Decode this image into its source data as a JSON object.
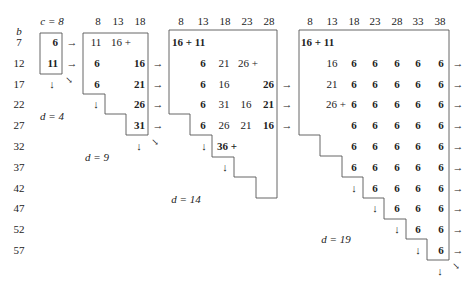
{
  "row_axis": {
    "label": "b",
    "values": [
      "7",
      "12",
      "17",
      "22",
      "27",
      "32",
      "37",
      "42",
      "47",
      "52",
      "57"
    ]
  },
  "panels": [
    {
      "id": "d4",
      "header_label": "c = 8",
      "columns": [
        "8"
      ],
      "caption": "d = 4",
      "cells": [
        {
          "row": 0,
          "col": 0,
          "text": "6",
          "bold": true
        },
        {
          "row": 1,
          "col": 0,
          "text": "11",
          "bold": true
        }
      ]
    },
    {
      "id": "d9",
      "columns": [
        "8",
        "13",
        "18"
      ],
      "caption": "d = 9",
      "cells": [
        {
          "row": 0,
          "col": 0,
          "text": "11",
          "bold": false
        },
        {
          "row": 0,
          "col": 1,
          "text": "16 +",
          "bold": false
        },
        {
          "row": 1,
          "col": 0,
          "text": "6",
          "bold": true
        },
        {
          "row": 1,
          "col": 2,
          "text": "16",
          "bold": true
        },
        {
          "row": 2,
          "col": 0,
          "text": "6",
          "bold": true
        },
        {
          "row": 2,
          "col": 2,
          "text": "21",
          "bold": true
        },
        {
          "row": 3,
          "col": 2,
          "text": "26",
          "bold": true
        },
        {
          "row": 4,
          "col": 2,
          "text": "31",
          "bold": true
        }
      ]
    },
    {
      "id": "d14",
      "columns": [
        "8",
        "13",
        "18",
        "23",
        "28"
      ],
      "caption": "d = 14",
      "cells": [
        {
          "row": 0,
          "col": 0,
          "text": "16 + 11",
          "bold": true
        },
        {
          "row": 1,
          "col": 1,
          "text": "6",
          "bold": true
        },
        {
          "row": 1,
          "col": 2,
          "text": "21",
          "bold": false
        },
        {
          "row": 1,
          "col": 3,
          "text": "26 +",
          "bold": false
        },
        {
          "row": 2,
          "col": 1,
          "text": "6",
          "bold": true
        },
        {
          "row": 2,
          "col": 2,
          "text": "16",
          "bold": false
        },
        {
          "row": 2,
          "col": 4,
          "text": "26",
          "bold": true
        },
        {
          "row": 3,
          "col": 1,
          "text": "6",
          "bold": true
        },
        {
          "row": 3,
          "col": 2,
          "text": "31",
          "bold": false
        },
        {
          "row": 3,
          "col": 3,
          "text": "16",
          "bold": false
        },
        {
          "row": 3,
          "col": 4,
          "text": "21",
          "bold": true
        },
        {
          "row": 4,
          "col": 1,
          "text": "6",
          "bold": true
        },
        {
          "row": 4,
          "col": 2,
          "text": "26",
          "bold": false
        },
        {
          "row": 4,
          "col": 3,
          "text": "21",
          "bold": false
        },
        {
          "row": 4,
          "col": 4,
          "text": "16",
          "bold": true
        },
        {
          "row": 5,
          "col": 2,
          "text": "36 +",
          "bold": true
        }
      ]
    },
    {
      "id": "d19",
      "columns": [
        "8",
        "13",
        "18",
        "23",
        "28",
        "33",
        "38"
      ],
      "caption": "d = 19",
      "cells": [
        {
          "row": 0,
          "col": 0,
          "text": "16 + 11",
          "bold": true
        },
        {
          "row": 1,
          "col": 1,
          "text": "16",
          "bold": false
        },
        {
          "row": 1,
          "col": 2,
          "text": "6",
          "bold": true
        },
        {
          "row": 1,
          "col": 3,
          "text": "6",
          "bold": true
        },
        {
          "row": 1,
          "col": 4,
          "text": "6",
          "bold": true
        },
        {
          "row": 1,
          "col": 5,
          "text": "6",
          "bold": true
        },
        {
          "row": 1,
          "col": 6,
          "text": "6",
          "bold": true
        },
        {
          "row": 2,
          "col": 1,
          "text": "21",
          "bold": false
        },
        {
          "row": 2,
          "col": 2,
          "text": "6",
          "bold": true
        },
        {
          "row": 2,
          "col": 3,
          "text": "6",
          "bold": true
        },
        {
          "row": 2,
          "col": 4,
          "text": "6",
          "bold": true
        },
        {
          "row": 2,
          "col": 5,
          "text": "6",
          "bold": true
        },
        {
          "row": 2,
          "col": 6,
          "text": "6",
          "bold": true
        },
        {
          "row": 3,
          "col": 1,
          "text": "26 +",
          "bold": false
        },
        {
          "row": 3,
          "col": 2,
          "text": "6",
          "bold": true
        },
        {
          "row": 3,
          "col": 3,
          "text": "6",
          "bold": true
        },
        {
          "row": 3,
          "col": 4,
          "text": "6",
          "bold": true
        },
        {
          "row": 3,
          "col": 5,
          "text": "6",
          "bold": true
        },
        {
          "row": 3,
          "col": 6,
          "text": "6",
          "bold": true
        },
        {
          "row": 4,
          "col": 2,
          "text": "6",
          "bold": true
        },
        {
          "row": 4,
          "col": 3,
          "text": "6",
          "bold": true
        },
        {
          "row": 4,
          "col": 4,
          "text": "6",
          "bold": true
        },
        {
          "row": 4,
          "col": 5,
          "text": "6",
          "bold": true
        },
        {
          "row": 4,
          "col": 6,
          "text": "6",
          "bold": true
        },
        {
          "row": 5,
          "col": 2,
          "text": "6",
          "bold": true
        },
        {
          "row": 5,
          "col": 3,
          "text": "6",
          "bold": true
        },
        {
          "row": 5,
          "col": 4,
          "text": "6",
          "bold": true
        },
        {
          "row": 5,
          "col": 5,
          "text": "6",
          "bold": true
        },
        {
          "row": 5,
          "col": 6,
          "text": "6",
          "bold": true
        },
        {
          "row": 6,
          "col": 2,
          "text": "6",
          "bold": true
        },
        {
          "row": 6,
          "col": 3,
          "text": "6",
          "bold": true
        },
        {
          "row": 6,
          "col": 4,
          "text": "6",
          "bold": true
        },
        {
          "row": 6,
          "col": 5,
          "text": "6",
          "bold": true
        },
        {
          "row": 6,
          "col": 6,
          "text": "6",
          "bold": true
        },
        {
          "row": 7,
          "col": 3,
          "text": "6",
          "bold": true
        },
        {
          "row": 7,
          "col": 4,
          "text": "6",
          "bold": true
        },
        {
          "row": 7,
          "col": 5,
          "text": "6",
          "bold": true
        },
        {
          "row": 7,
          "col": 6,
          "text": "6",
          "bold": true
        },
        {
          "row": 8,
          "col": 4,
          "text": "6",
          "bold": true
        },
        {
          "row": 8,
          "col": 5,
          "text": "6",
          "bold": true
        },
        {
          "row": 8,
          "col": 6,
          "text": "6",
          "bold": true
        },
        {
          "row": 9,
          "col": 5,
          "text": "6",
          "bold": true
        },
        {
          "row": 9,
          "col": 6,
          "text": "6",
          "bold": true
        },
        {
          "row": 10,
          "col": 6,
          "text": "6",
          "bold": true
        }
      ]
    }
  ],
  "glyphs": {
    "right_arrow": "→",
    "down_arrow": "↓",
    "diag_arrow": "↘"
  }
}
